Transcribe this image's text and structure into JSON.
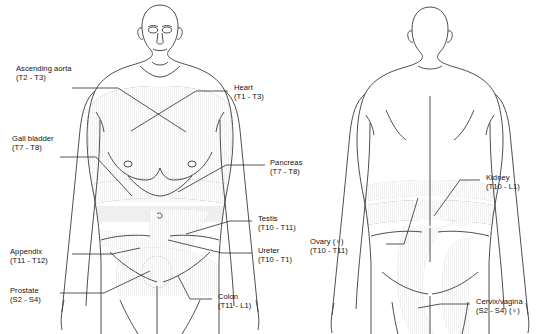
{
  "figure": {
    "views": [
      {
        "name": "anterior",
        "label": "front view"
      },
      {
        "name": "posterior",
        "label": "back view"
      }
    ],
    "background_color": "#ffffff",
    "outline_color": "#3a3a3a",
    "leader_color": "#2b2b2b"
  },
  "shading": {
    "dark": "#8f8f8f",
    "mid": "#a8a8a8",
    "light": "#c9c9c9",
    "pale": "#dedede",
    "very_pale": "#ebebeb",
    "spot": "#7b7b7b"
  },
  "labels": {
    "ascending_aorta": {
      "organ": "Ascending aorta",
      "levels": "(T2 - T3)"
    },
    "heart": {
      "organ": "Heart",
      "levels": "(T1 - T3)"
    },
    "gall_bladder": {
      "organ": "Gall bladder",
      "levels": "(T7 - T8)"
    },
    "pancreas": {
      "organ": "Pancreas",
      "levels": "(T7 - T8)"
    },
    "appendix": {
      "organ": "Appendix",
      "levels": "(T11 - T12)"
    },
    "testis": {
      "organ": "Testis",
      "levels": "(T10 - T11)"
    },
    "ureter": {
      "organ": "Ureter",
      "levels": "(T10 - T1)"
    },
    "prostate": {
      "organ": "Prostate",
      "levels": "(S2 - S4)"
    },
    "colon": {
      "organ": "Colon",
      "levels": "(T11 - L1)"
    },
    "kidney": {
      "organ": "Kidney",
      "levels": "(T10 - L1)"
    },
    "ovary": {
      "organ": "Ovary (♀)",
      "levels": "(T10 - T11)"
    },
    "cervix_vagina": {
      "organ": "Cervix/vagina",
      "levels": "(S2 - S4) (♀)"
    }
  }
}
